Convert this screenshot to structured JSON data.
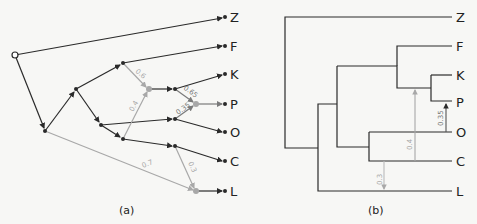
{
  "panel_a": {
    "caption": "(a)",
    "leaves": [
      "Z",
      "F",
      "K",
      "P",
      "O",
      "C",
      "L"
    ],
    "weights": {
      "w06": "0.6",
      "w04": "0.4",
      "w065": "0.65",
      "w035": "0.35",
      "w07": "0.7",
      "w03": "0.3"
    }
  },
  "panel_b": {
    "caption": "(b)",
    "leaves": [
      "Z",
      "F",
      "K",
      "P",
      "O",
      "C",
      "L"
    ],
    "weights": {
      "w035": "0.35",
      "w04": "0.4",
      "w03": "0.3"
    }
  },
  "colors": {
    "tree": "#2a2a2a",
    "reticulate": "#a8a8a8",
    "mid_reticulate": "#7a7a7a"
  }
}
